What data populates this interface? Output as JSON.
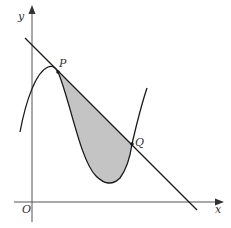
{
  "diagram": {
    "type": "calculus-area-between-curve-and-line",
    "labels": {
      "y_axis": "y",
      "x_axis": "x",
      "origin": "O",
      "point_p": "P",
      "point_q": "Q"
    },
    "colors": {
      "axis": "#555555",
      "curve": "#1a1a1a",
      "line": "#1a1a1a",
      "shade": "#c4c4c4",
      "text": "#333333"
    }
  }
}
